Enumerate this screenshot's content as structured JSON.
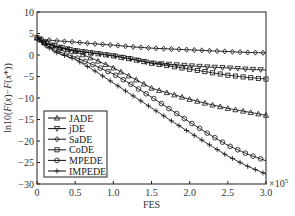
{
  "chart_data": {
    "type": "line",
    "title": "",
    "xlabel": "FES",
    "ylabel": "ln10(F(x)-F(x*))",
    "x_scale_note": "×10^5",
    "xlim": [
      0,
      3.0
    ],
    "ylim": [
      -30,
      10
    ],
    "xticks": [
      "0",
      "0.5",
      "1.0",
      "1.5",
      "2.0",
      "2.5",
      "3.0"
    ],
    "yticks": [
      "10",
      "5",
      "0",
      "-5",
      "-10",
      "-15",
      "-20",
      "-25",
      "-30"
    ],
    "grid": false,
    "legend_position": "lower left",
    "x": [
      0,
      0.1,
      0.25,
      0.5,
      0.75,
      1.0,
      1.25,
      1.5,
      1.75,
      2.0,
      2.25,
      2.5,
      2.75,
      3.0
    ],
    "series": [
      {
        "name": "JADE",
        "marker": "triangle-up",
        "values": [
          4.0,
          2.8,
          1.8,
          0.8,
          -1.0,
          -3.0,
          -5.3,
          -7.7,
          -9.0,
          -10.3,
          -11.4,
          -12.4,
          -13.2,
          -14.0
        ]
      },
      {
        "name": "jDE",
        "marker": "triangle-down",
        "values": [
          4.0,
          2.9,
          2.0,
          1.0,
          0.4,
          -0.2,
          -1.0,
          -1.9,
          -2.2,
          -2.5,
          -2.8,
          -3.0,
          -3.3,
          -3.5
        ]
      },
      {
        "name": "SaDE",
        "marker": "diamond",
        "values": [
          4.0,
          3.6,
          3.3,
          3.0,
          2.6,
          2.3,
          1.9,
          1.6,
          1.4,
          1.2,
          1.0,
          0.8,
          0.6,
          0.5
        ]
      },
      {
        "name": "CoDE",
        "marker": "square",
        "values": [
          4.0,
          2.9,
          2.0,
          1.0,
          0.4,
          -0.2,
          -1.0,
          -1.9,
          -2.6,
          -3.3,
          -4.0,
          -4.7,
          -5.2,
          -5.6
        ]
      },
      {
        "name": "MPEDE",
        "marker": "circle",
        "values": [
          4.0,
          2.5,
          1.0,
          -0.5,
          -2.4,
          -4.4,
          -7.0,
          -9.8,
          -12.7,
          -15.6,
          -18.4,
          -21.0,
          -23.0,
          -24.6
        ]
      },
      {
        "name": "IMPEDE",
        "marker": "plus",
        "values": [
          4.0,
          2.3,
          0.6,
          -1.0,
          -3.6,
          -6.5,
          -9.4,
          -12.3,
          -15.2,
          -18.0,
          -20.8,
          -23.5,
          -25.8,
          -27.7
        ]
      }
    ]
  }
}
